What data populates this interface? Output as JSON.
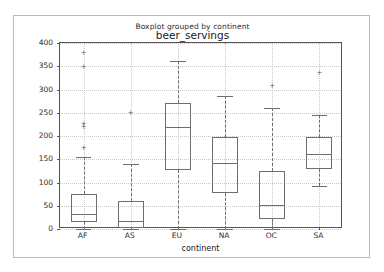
{
  "figure": {
    "suptitle": "Boxplot grouped by continent",
    "title": "beer_servings",
    "background": "#ffffff",
    "border_color": "#b9b9b9"
  },
  "axes": {
    "xlabel": "continent",
    "ylabel": "",
    "ylim": [
      0,
      400
    ],
    "ytick_labels": [
      "0",
      "50",
      "100",
      "150",
      "200",
      "250",
      "300",
      "350",
      "400"
    ],
    "xtick_labels": [
      "AF",
      "AS",
      "EU",
      "NA",
      "OC",
      "SA"
    ],
    "grid": true,
    "line_color": "#6e6e6e",
    "spine_color": "#555555"
  },
  "chart_data": {
    "type": "box",
    "title": "beer_servings",
    "suptitle": "Boxplot grouped by continent",
    "xlabel": "continent",
    "ylabel": "",
    "ylim": [
      0,
      400
    ],
    "yticks": [
      0,
      50,
      100,
      150,
      200,
      250,
      300,
      350,
      400
    ],
    "grid": true,
    "legend": null,
    "categories": [
      "AF",
      "AS",
      "EU",
      "NA",
      "OC",
      "SA"
    ],
    "boxes": [
      {
        "label": "AF",
        "whisker_low": 0,
        "q1": 15,
        "median": 32,
        "q3": 76,
        "whisker_high": 155,
        "fliers": [
          173,
          218,
          224,
          347,
          376
        ]
      },
      {
        "label": "AS",
        "whisker_low": 0,
        "q1": 3,
        "median": 17,
        "q3": 60,
        "whisker_high": 140,
        "fliers": [
          247
        ]
      },
      {
        "label": "EU",
        "whisker_low": 0,
        "q1": 127,
        "median": 219,
        "q3": 270,
        "whisker_high": 361,
        "fliers": []
      },
      {
        "label": "NA",
        "whisker_low": 1,
        "q1": 78,
        "median": 143,
        "q3": 198,
        "whisker_high": 285,
        "fliers": []
      },
      {
        "label": "OC",
        "whisker_low": 0,
        "q1": 21,
        "median": 52,
        "q3": 125,
        "whisker_high": 261,
        "fliers": [
          306
        ]
      },
      {
        "label": "SA",
        "whisker_low": 93,
        "q1": 129,
        "median": 162,
        "q3": 198,
        "whisker_high": 245,
        "fliers": [
          333
        ]
      }
    ]
  }
}
